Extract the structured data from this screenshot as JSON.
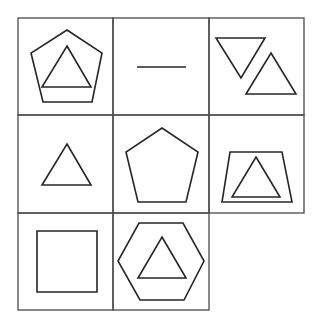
{
  "puzzle": {
    "type": "3x3 pattern grid, last cell missing",
    "grid": {
      "cols_x": [
        18,
        113,
        209,
        304
      ],
      "rows_y": [
        18,
        115,
        213,
        310
      ],
      "line_color": "#4a4a4a"
    },
    "shape_color": "#262626",
    "cells": [
      {
        "row": 1,
        "col": 1,
        "description": "triangle inside pentagon",
        "shapes": [
          {
            "name": "pentagon",
            "points": "67,30 102,53 92,102 43,102 31,53"
          },
          {
            "name": "triangle",
            "points": "67,46 91,87 42,87"
          }
        ]
      },
      {
        "row": 1,
        "col": 2,
        "description": "horizontal line",
        "shapes": [
          {
            "name": "line",
            "points": "137,67 186,67"
          }
        ]
      },
      {
        "row": 1,
        "col": 3,
        "description": "inverted triangle and upright triangle",
        "shapes": [
          {
            "name": "triangle-inverted",
            "points": "216,38 265,38 241,78"
          },
          {
            "name": "triangle",
            "points": "271,53 296,94 246,94"
          }
        ]
      },
      {
        "row": 2,
        "col": 1,
        "description": "triangle",
        "shapes": [
          {
            "name": "triangle",
            "points": "67,144 91,185 42,185"
          }
        ]
      },
      {
        "row": 2,
        "col": 2,
        "description": "pentagon",
        "shapes": [
          {
            "name": "pentagon",
            "points": "162,128 198,152 186,202 138,202 126,152"
          }
        ]
      },
      {
        "row": 2,
        "col": 3,
        "description": "triangle inside trapezoid",
        "shapes": [
          {
            "name": "trapezoid",
            "points": "230,152 282,152 292,202 222,202"
          },
          {
            "name": "triangle",
            "points": "256,157 280,197 232,197"
          }
        ]
      },
      {
        "row": 3,
        "col": 1,
        "description": "square",
        "shapes": [
          {
            "name": "square",
            "points": "37,231 97,231 97,292 37,292"
          }
        ]
      },
      {
        "row": 3,
        "col": 2,
        "description": "triangle inside hexagon",
        "shapes": [
          {
            "name": "hexagon",
            "points": "139,223 183,223 204,261 184,300 140,300 118,261"
          },
          {
            "name": "triangle",
            "points": "162,237 186,278 138,278"
          }
        ]
      }
    ],
    "missing_cell": {
      "row": 3,
      "col": 3
    }
  }
}
